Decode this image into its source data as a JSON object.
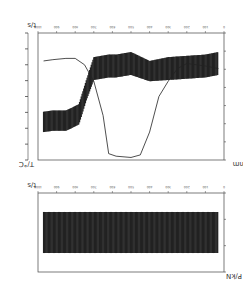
{
  "chart_data": [
    {
      "type": "line",
      "panel": "top",
      "xlabel": "t/s",
      "ylabel_left": "T/°C",
      "ylabel_right": "D/mm",
      "x_ticks": [
        "0",
        "100",
        "200",
        "300",
        "400",
        "500",
        "600",
        "700",
        "800",
        "900",
        "1000"
      ],
      "y_left_ticks": [
        "",
        "",
        "",
        "",
        "",
        "",
        "",
        "",
        ""
      ],
      "y_right_ticks": [
        "",
        "",
        "",
        "",
        "",
        "",
        "",
        ""
      ],
      "xlim": [
        0,
        1000
      ],
      "series": [
        {
          "name": "T/°C (oscillating band)",
          "axis": "left",
          "x": [
            30,
            80,
            150,
            180,
            220,
            260,
            300,
            380,
            420,
            500,
            600,
            700,
            800,
            900,
            970
          ],
          "center": [
            0.3,
            0.31,
            0.31,
            0.33,
            0.36,
            0.55,
            0.72,
            0.74,
            0.74,
            0.76,
            0.7,
            0.72,
            0.73,
            0.74,
            0.76
          ],
          "amplitude": [
            0.08,
            0.08,
            0.08,
            0.08,
            0.08,
            0.08,
            0.09,
            0.09,
            0.09,
            0.09,
            0.08,
            0.09,
            0.09,
            0.09,
            0.09
          ]
        },
        {
          "name": "D/mm",
          "axis": "right",
          "x": [
            30,
            80,
            150,
            200,
            250,
            300,
            350,
            380,
            420,
            500,
            550,
            600,
            650,
            700,
            750,
            800,
            900,
            970
          ],
          "values": [
            0.78,
            0.79,
            0.8,
            0.8,
            0.75,
            0.62,
            0.35,
            0.05,
            0.03,
            0.02,
            0.04,
            0.22,
            0.5,
            0.62,
            0.72,
            0.76,
            0.74,
            0.72
          ]
        }
      ]
    },
    {
      "type": "line",
      "panel": "bottom",
      "xlabel": "t/s",
      "ylabel": "P/kN",
      "x_ticks": [
        "0",
        "100",
        "200",
        "300",
        "400",
        "500",
        "600",
        "700",
        "800",
        "900",
        "1000"
      ],
      "xlim": [
        0,
        1000
      ],
      "series": [
        {
          "name": "P/kN (oscillating band)",
          "x": [
            30,
            970
          ],
          "center": [
            0.5,
            0.5
          ],
          "amplitude": [
            0.26,
            0.26
          ]
        }
      ]
    }
  ]
}
